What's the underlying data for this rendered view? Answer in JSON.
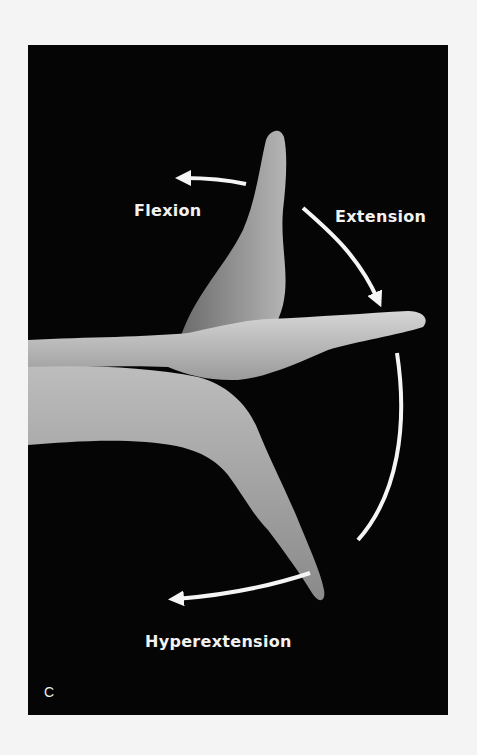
{
  "figure": {
    "panel_letter": "C",
    "labels": {
      "flexion": "Flexion",
      "extension": "Extension",
      "hyperextension": "Hyperextension"
    },
    "colors": {
      "background": "#050505",
      "page": "#f4f4f4",
      "arrow": "#f5f5f5",
      "skin": "#c8c8c8"
    }
  }
}
